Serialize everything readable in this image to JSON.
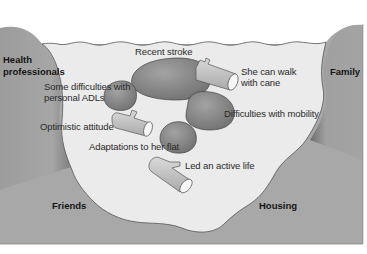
{
  "diagram": {
    "type": "kawa-river-model-cross-section",
    "colors": {
      "background": "#ffffff",
      "river_water": "#ececec",
      "riverbed_walls": "#a9a9a9",
      "rocks": "#8e8e8e",
      "logs": "#c9c9c9",
      "text": "#2a2a2a"
    },
    "banks": {
      "left_top": "Health\nprofessionals",
      "left_top_line1": "Health",
      "left_top_line2": "professionals",
      "right_top": "Family",
      "bottom_left": "Friends",
      "bottom_right": "Housing"
    },
    "rocks": [
      {
        "label": "Recent stroke"
      },
      {
        "label": "Some difficulties with personal ADLs",
        "line1": "Some difficulties with",
        "line2": "personal ADLs"
      },
      {
        "label": "Difficulties with mobility"
      },
      {
        "label": "Adaptations to her flat"
      }
    ],
    "driftwood": [
      {
        "label": "She can walk with cane",
        "line1": "She can walk",
        "line2": "with cane"
      },
      {
        "label": "Optimistic attitude"
      },
      {
        "label": "Led an active life"
      }
    ]
  }
}
